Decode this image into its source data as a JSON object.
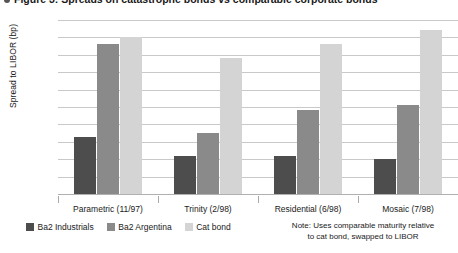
{
  "title": {
    "text": "Figure 3: Spreads on catastrophe bonds vs comparable corporate bonds",
    "bullet_icon": "bullet-icon"
  },
  "chart_data": {
    "type": "bar",
    "title": "",
    "xlabel": "",
    "ylabel": "Spread to LIBOR (bp)",
    "ylim": [
      0,
      500
    ],
    "ytick_step": 50,
    "yticks": [
      500,
      450,
      400,
      350,
      300,
      250,
      200,
      150,
      100,
      50,
      0
    ],
    "grid": true,
    "legend_position": "bottom-left",
    "categories": [
      "Parametric (11/97)",
      "Trinity (2/98)",
      "Residential (6/98)",
      "Mosaic (7/98)"
    ],
    "series": [
      {
        "name": "Ba2 Industrials",
        "color": "#4d4d4d",
        "values": [
          165,
          110,
          110,
          100
        ]
      },
      {
        "name": "Ba2 Argentina",
        "color": "#8a8a8a",
        "values": [
          430,
          175,
          240,
          255
        ]
      },
      {
        "name": "Cat bond",
        "color": "#d4d4d4",
        "values": [
          450,
          390,
          430,
          470
        ]
      }
    ],
    "annotations": [
      "Note: Uses comparable maturity relative to cat bond, swapped to LIBOR"
    ]
  },
  "note": {
    "line1": "Note: Uses comparable maturity relative",
    "line2": "to cat bond, swapped to LIBOR"
  },
  "colors": {
    "gridline": "#c9c9c9",
    "axis": "#b0b0b0",
    "text": "#1a1a1a"
  }
}
